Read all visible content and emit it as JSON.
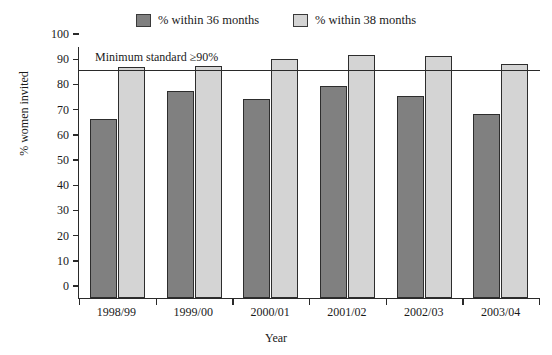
{
  "chart_data": {
    "type": "bar",
    "title": "",
    "xlabel": "Year",
    "ylabel": "% women invited",
    "categories": [
      "1998/99",
      "1999/00",
      "2000/01",
      "2001/02",
      "2002/03",
      "2003/04"
    ],
    "series": [
      {
        "name": "% within 36 months",
        "color": "#808080",
        "values": [
          71,
          82,
          79,
          84,
          80,
          73
        ]
      },
      {
        "name": "% within 38 months",
        "color": "#d4d4d4",
        "values": [
          91.5,
          92,
          95,
          96.5,
          96,
          93
        ]
      }
    ],
    "ylim": [
      0,
      100
    ],
    "yticks": [
      0,
      10,
      20,
      30,
      40,
      50,
      60,
      70,
      80,
      90,
      100
    ],
    "ytick_labels": [
      "0",
      "10",
      "20",
      "30",
      "40",
      "50",
      "60",
      "70",
      "80",
      "90",
      "100"
    ],
    "grid": false,
    "legend_position": "top-center",
    "annotations": [
      {
        "text": "Minimum standard ≥90%",
        "value": 90,
        "type": "reference-line"
      }
    ],
    "reference_line_value": 90
  },
  "legend": {
    "items": [
      {
        "label": "% within 36 months",
        "color": "#808080"
      },
      {
        "label": "% within 38 months",
        "color": "#d4d4d4"
      }
    ]
  },
  "axes": {
    "y_title": "% women invited",
    "x_title": "Year"
  },
  "colors": {
    "series_36": "#808080",
    "series_38": "#d4d4d4",
    "axis": "#2a2a2a",
    "bar_outline": "#2d2d2d",
    "background": "#ffffff"
  }
}
